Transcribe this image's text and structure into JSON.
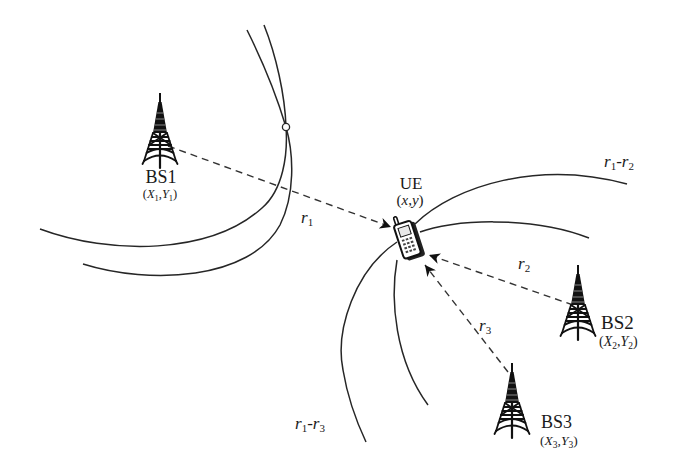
{
  "figure": {
    "type": "TDOA positioning diagram",
    "colors": {
      "line": "#262626",
      "background": "#ffffff",
      "tower": "#111111"
    },
    "base_stations": [
      {
        "name": "BS1",
        "coord": {
          "open": "(",
          "x": "X",
          "x_sub": "1",
          "sep": ",",
          "y": "Y",
          "y_sub": "1",
          "close": ")"
        }
      },
      {
        "name": "BS2",
        "coord": {
          "open": "(",
          "x": "X",
          "x_sub": "2",
          "sep": ",",
          "y": "Y",
          "y_sub": "2",
          "close": ")"
        }
      },
      {
        "name": "BS3",
        "coord": {
          "open": "(",
          "x": "X",
          "x_sub": "3",
          "sep": ",",
          "y": "Y",
          "y_sub": "3",
          "close": ")"
        }
      }
    ],
    "ue": {
      "name": "UE",
      "coord": {
        "open": "(",
        "x": "x",
        "sep": ",",
        "y": "y",
        "close": ")"
      }
    },
    "ranges": [
      {
        "var": "r",
        "sub": "1"
      },
      {
        "var": "r",
        "sub": "2"
      },
      {
        "var": "r",
        "sub": "3"
      }
    ],
    "hyperbolas": [
      {
        "a": "r",
        "a_sub": "1",
        "minus": "-",
        "b": "r",
        "b_sub": "2"
      },
      {
        "a": "r",
        "a_sub": "1",
        "minus": "-",
        "b": "r",
        "b_sub": "3"
      }
    ],
    "icons": {
      "base_station": "radio-tower-icon",
      "ue": "mobile-phone-icon"
    }
  }
}
